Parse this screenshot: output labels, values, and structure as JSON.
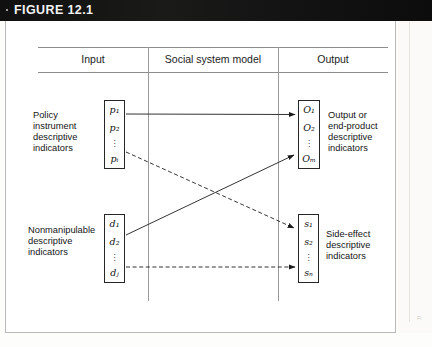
{
  "header": {
    "bullet": "·",
    "title": "FIGURE 12.1"
  },
  "columns": {
    "input": "Input",
    "model": "Social system model",
    "output": "Output"
  },
  "captions": {
    "policy": "Policy\ninstrument\ndescriptive\nindicators",
    "nonmanipulable": "Nonmanipulable\ndescriptive\nindicators",
    "output": "Output or\nend-product\ndescriptive\nindicators",
    "side_effect": "Side-effect\ndescriptive\nindicators"
  },
  "boxes": {
    "policy_indicators": {
      "name": "p",
      "items": [
        "p₁",
        "p₂",
        "pᵢ"
      ],
      "dots": "⋮"
    },
    "nonmanipulable_indicators": {
      "name": "d",
      "items": [
        "d₁",
        "d₂",
        "dⱼ"
      ],
      "dots": "⋮"
    },
    "output_indicators": {
      "name": "O",
      "items": [
        "O₁",
        "O₂",
        "Oₘ"
      ],
      "dots": "⋮"
    },
    "side_effect_indicators": {
      "name": "s",
      "items": [
        "s₁",
        "s₂",
        "sₙ"
      ],
      "dots": "⋮"
    }
  },
  "arrows": [
    {
      "id": "p-to-output",
      "from": "policy_indicators",
      "to": "output_indicators",
      "style": "solid"
    },
    {
      "id": "p-to-side-effect",
      "from": "policy_indicators",
      "to": "side_effect_indicators",
      "style": "dashed"
    },
    {
      "id": "d-to-output",
      "from": "nonmanipulable_indicators",
      "to": "output_indicators",
      "style": "solid"
    },
    {
      "id": "d-to-side-effect",
      "from": "nonmanipulable_indicators",
      "to": "side_effect_indicators",
      "style": "dashed"
    }
  ],
  "colors": {
    "header_bg": "#0d0d0d",
    "header_text": "#f2f2f2",
    "rule": "#8d8d8d",
    "box_border": "#262626",
    "arrow": "#1c1c1c"
  },
  "scan_artifact": "Fi"
}
